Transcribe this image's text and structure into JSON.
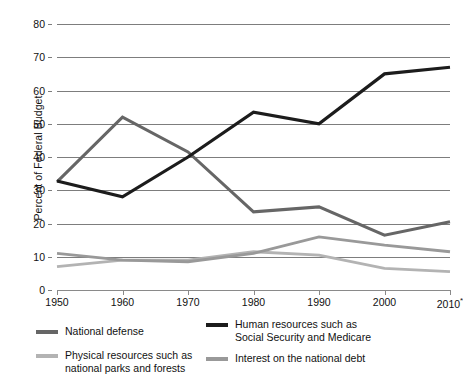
{
  "chart_data": {
    "type": "line",
    "title": "",
    "xlabel": "",
    "ylabel": "Percent of Federal Budget",
    "x": [
      1950,
      1960,
      1970,
      1980,
      1990,
      2000,
      2010
    ],
    "xtick_labels": [
      "1950",
      "1960",
      "1970",
      "1980",
      "1990",
      "2000",
      "2010"
    ],
    "xtick_note": "*",
    "xlim": [
      1950,
      2010
    ],
    "ylim": [
      0,
      80
    ],
    "yticks": [
      0,
      10,
      20,
      30,
      40,
      50,
      60,
      70,
      80
    ],
    "ytick_labels": [
      "0",
      "10",
      "20",
      "30",
      "40",
      "50",
      "60",
      "70",
      "80"
    ],
    "grid": true,
    "legend_position": "below",
    "series": [
      {
        "name": "National defense",
        "color": "#666666",
        "values": [
          32.5,
          52.0,
          41.5,
          23.5,
          25.0,
          16.5,
          20.5
        ]
      },
      {
        "name": "Human resources such as\nSocial Security and Medicare",
        "color": "#1c1c1c",
        "values": [
          32.8,
          28.0,
          40.0,
          53.5,
          50.0,
          65.0,
          67.0
        ]
      },
      {
        "name": "Physical resources such as\nnational parks and forests",
        "color": "#b3b3b3",
        "values": [
          7.0,
          9.0,
          9.0,
          11.5,
          10.5,
          6.5,
          5.5
        ]
      },
      {
        "name": "Interest on the national debt",
        "color": "#999999",
        "values": [
          11.0,
          9.0,
          8.5,
          11.0,
          16.0,
          13.5,
          11.5
        ]
      }
    ]
  }
}
